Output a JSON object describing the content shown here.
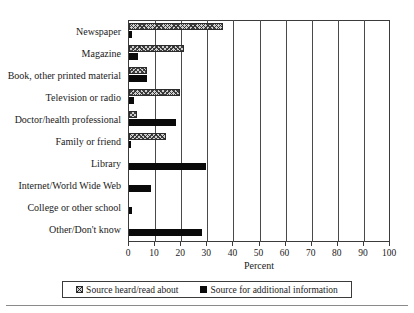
{
  "chart_data": {
    "type": "bar",
    "orientation": "horizontal",
    "title": "",
    "xlabel": "Percent",
    "ylabel": "",
    "xlim": [
      0,
      100
    ],
    "xticks": [
      0,
      10,
      20,
      30,
      40,
      50,
      60,
      70,
      80,
      90,
      100
    ],
    "xtick_labels": [
      "0",
      "10",
      "20",
      "30",
      "40",
      "50",
      "60",
      "70",
      "80",
      "90",
      "100"
    ],
    "grid": true,
    "grid_axis": "x",
    "legend_position": "bottom",
    "categories": [
      "Newspaper",
      "Magazine",
      "Book, other printed material",
      "Television or radio",
      "Doctor/health professional",
      "Family or friend",
      "Library",
      "Internet/World Wide Web",
      "College or other school",
      "Other/Don't know"
    ],
    "series": [
      {
        "name": "Source heard/read about",
        "style": "hatched",
        "color": "#cfcfcf",
        "values": [
          36,
          21,
          7,
          19.5,
          3,
          14,
          0,
          0,
          0,
          0
        ]
      },
      {
        "name": "Source for additional information",
        "style": "solid",
        "color": "#0a0a0a",
        "values": [
          1,
          3.5,
          7,
          2,
          18,
          0.5,
          29.5,
          8.5,
          1,
          28
        ]
      }
    ]
  },
  "legend": {
    "items": [
      {
        "label": "Source heard/read about",
        "swatch": "hatched-square-icon"
      },
      {
        "label": "Source for additional information",
        "swatch": "solid-square-icon"
      }
    ]
  }
}
